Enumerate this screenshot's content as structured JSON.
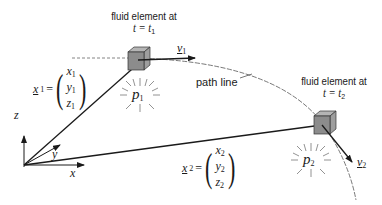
{
  "diagram": {
    "element1_caption": {
      "line1": "fluid element at",
      "line2_var": "t",
      "line2_eq": " = ",
      "line2_rhs": "t",
      "line2_sub": "1"
    },
    "element2_caption": {
      "line1": "fluid element at",
      "line2_var": "t",
      "line2_eq": " = ",
      "line2_rhs": "t",
      "line2_sub": "2"
    },
    "path_label": "path line",
    "axes": {
      "x": "x",
      "y": "y",
      "z": "z"
    },
    "position1": {
      "name": "x",
      "sub": "1",
      "components": [
        "x",
        "y",
        "z"
      ],
      "comp_sub": "1"
    },
    "position2": {
      "name": "x",
      "sub": "2",
      "components": [
        "x",
        "y",
        "z"
      ],
      "comp_sub": "2"
    },
    "velocity1": {
      "name": "v",
      "sub": "1"
    },
    "velocity2": {
      "name": "v",
      "sub": "2"
    },
    "pressure1": {
      "name": "p",
      "sub": "1"
    },
    "pressure2": {
      "name": "p",
      "sub": "2"
    },
    "colors": {
      "line": "#1a1a1a",
      "cube_front": "#8c8c8c",
      "cube_top": "#b5b5b5",
      "cube_side": "#9e9e9e",
      "path": "#555555"
    }
  }
}
